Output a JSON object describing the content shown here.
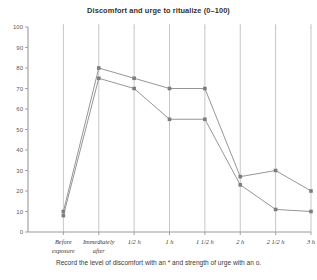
{
  "chart_data": {
    "type": "line",
    "title": "Discomfort and urge to ritualize (0–100)",
    "caption": "Record the level of discomfort with an * and strength of urge with an o.",
    "xlabel": "",
    "ylabel": "",
    "ylim": [
      0,
      100
    ],
    "ytick_step": 10,
    "yticks": [
      "0",
      "10",
      "20",
      "30",
      "40",
      "50",
      "60",
      "70",
      "80",
      "90",
      "100"
    ],
    "grid": "vertical",
    "legend": "none",
    "categories": [
      "Before exposure",
      "Immediately after",
      "1/2 h",
      "1 h",
      "1 1/2 h",
      "2 h",
      "2 1/2 h",
      "3 h"
    ],
    "category_lines": [
      [
        "Before",
        "exposure"
      ],
      [
        "Immediately",
        "after"
      ],
      [
        "1/2 h",
        ""
      ],
      [
        "1 h",
        ""
      ],
      [
        "1 1/2 h",
        ""
      ],
      [
        "2 h",
        ""
      ],
      [
        "2 1/2 h",
        ""
      ],
      [
        "3 h",
        ""
      ]
    ],
    "series": [
      {
        "name": "Discomfort",
        "marker": "*",
        "color": "#8a8a87",
        "values": [
          10,
          80,
          75,
          70,
          70,
          27,
          30,
          20
        ]
      },
      {
        "name": "Urge to ritualize",
        "marker": "o",
        "color": "#8a8a87",
        "values": [
          8,
          75,
          70,
          55,
          55,
          23,
          11,
          10
        ]
      }
    ]
  },
  "chart": {
    "title": "Discomfort and urge to ritualize (0–100)",
    "caption": "Record the level of discomfort with an * and strength of urge with an o."
  }
}
